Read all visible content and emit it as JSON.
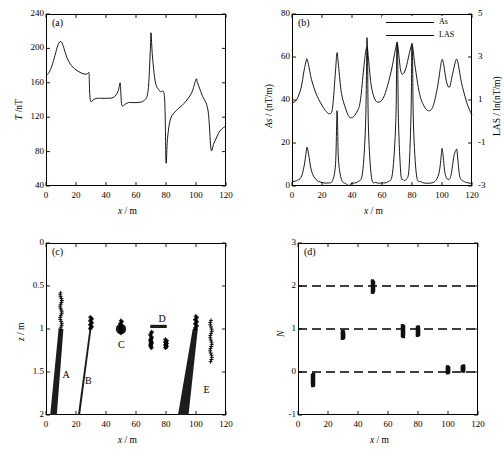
{
  "figure": {
    "panels": [
      "(a)",
      "(b)",
      "(c)",
      "(d)"
    ]
  },
  "axis": {
    "x_label": "x / m",
    "x_ticks": [
      "0",
      "20",
      "40",
      "60",
      "80",
      "100",
      "120"
    ],
    "x_values": [
      0,
      20,
      40,
      60,
      80,
      100,
      120
    ]
  },
  "chart_data": [
    {
      "id": "panel-a",
      "type": "line",
      "tag": "(a)",
      "title": "",
      "xlabel": "x / m",
      "ylabel": "T / nT",
      "xlim": [
        0,
        120
      ],
      "ylim": [
        40,
        240
      ],
      "xticks": [
        0,
        20,
        40,
        60,
        80,
        100,
        120
      ],
      "yticks": [
        40,
        80,
        120,
        160,
        200,
        240
      ],
      "grid": false,
      "legend": "none",
      "series": [
        {
          "name": "T",
          "x": [
            0,
            2,
            4,
            6,
            8,
            10,
            12,
            14,
            17,
            20,
            24,
            27,
            28.6,
            28.8,
            29.2,
            30,
            32,
            35,
            40,
            45,
            48,
            49.4,
            49.8,
            50.3,
            51,
            52,
            55,
            60,
            65,
            68,
            69.6,
            70,
            71,
            73,
            76,
            79,
            80,
            81,
            83,
            87,
            92,
            97,
            100,
            101,
            104,
            108,
            110,
            112,
            116,
            120
          ],
          "y": [
            168,
            172,
            180,
            192,
            204,
            208,
            200,
            189,
            180,
            175,
            171,
            170,
            172,
            166,
            146,
            138,
            141,
            142,
            142,
            143,
            150,
            160,
            152,
            136,
            133,
            134,
            137,
            137,
            139,
            150,
            200,
            218,
            190,
            160,
            150,
            143,
            68,
            95,
            118,
            128,
            136,
            148,
            164,
            160,
            146,
            128,
            83,
            90,
            104,
            110
          ]
        }
      ]
    },
    {
      "id": "panel-b",
      "type": "line",
      "tag": "(b)",
      "title": "",
      "xlabel": "x / m",
      "ylabel": "As / (nT/m)",
      "y2label": "LAS / ln(nT/m)",
      "xlim": [
        0,
        120
      ],
      "ylim": [
        0,
        80
      ],
      "y2lim": [
        -3,
        5
      ],
      "xticks": [
        0,
        20,
        40,
        60,
        80,
        100,
        120
      ],
      "yticks": [
        0,
        20,
        40,
        60,
        80
      ],
      "y2ticks": [
        -3,
        -1,
        1,
        3,
        5
      ],
      "grid": false,
      "legend": [
        "As",
        "LAS"
      ],
      "legend_position": "top-right",
      "series": [
        {
          "name": "As",
          "axis": "left",
          "x": [
            0,
            3,
            6,
            8,
            9.5,
            10,
            11,
            13,
            16,
            20,
            24,
            27,
            29,
            29.8,
            30,
            30.4,
            31,
            33,
            36,
            37.4,
            37.8,
            38.2,
            40,
            44,
            47,
            49,
            49.8,
            50,
            50.4,
            51,
            53,
            56,
            60,
            64,
            67,
            69.2,
            69.8,
            70,
            70.4,
            71,
            72.5,
            74,
            76,
            78,
            79.4,
            79.8,
            80,
            80.4,
            81,
            83,
            86,
            90,
            95,
            98,
            99.6,
            100,
            100.6,
            102,
            104,
            106,
            108,
            109.6,
            110,
            110.6,
            112,
            115,
            118,
            120
          ],
          "y": [
            2,
            2.5,
            4,
            9,
            16,
            18,
            15,
            7,
            3,
            1.6,
            1.4,
            2.5,
            10,
            30,
            35,
            29,
            12,
            3,
            1,
            0.4,
            0.1,
            0.4,
            1.2,
            2,
            6,
            28,
            60,
            69,
            58,
            26,
            4,
            1.6,
            1.4,
            2,
            6,
            30,
            62,
            72,
            63,
            30,
            6,
            3,
            3,
            8,
            35,
            62,
            66,
            58,
            28,
            5,
            2,
            1.3,
            2,
            6,
            15,
            17.5,
            15,
            6,
            3,
            5,
            14,
            17,
            16.5,
            12,
            4,
            2,
            1.4,
            1.2
          ]
        },
        {
          "name": "LAS",
          "axis": "right",
          "x": [
            0,
            3,
            6,
            8,
            9.5,
            10,
            11,
            13,
            16,
            20,
            23,
            25,
            27,
            29,
            30,
            31,
            33,
            36,
            38,
            40,
            42,
            44,
            45,
            46,
            47,
            48,
            49,
            49.6,
            50,
            50.5,
            51,
            53,
            56,
            60,
            63,
            66,
            68,
            69.4,
            70,
            70.6,
            71.5,
            72.5,
            74,
            76,
            78,
            79.4,
            80,
            80.6,
            82,
            85,
            88,
            91,
            94,
            97,
            99,
            100,
            101,
            103,
            105,
            107,
            109,
            110,
            111,
            113,
            116,
            118,
            120
          ],
          "y": [
            0.87,
            1.0,
            1.55,
            2.35,
            2.85,
            2.9,
            2.65,
            1.95,
            1.3,
            0.75,
            0.45,
            0.37,
            0.62,
            2.35,
            3.2,
            2.6,
            1.3,
            0.55,
            0.22,
            0.18,
            0.3,
            0.55,
            0.75,
            1.2,
            1.9,
            2.6,
            3.2,
            3.42,
            3.45,
            3.32,
            2.9,
            1.6,
            0.95,
            1.0,
            1.5,
            2.3,
            3.0,
            3.5,
            3.62,
            3.5,
            2.9,
            2.35,
            2.2,
            2.5,
            3.1,
            3.5,
            3.58,
            3.42,
            2.6,
            1.3,
            0.72,
            0.5,
            0.7,
            1.6,
            2.55,
            2.88,
            2.7,
            1.85,
            1.6,
            2.2,
            2.8,
            2.88,
            2.6,
            1.8,
            1.0,
            0.6,
            0.3
          ]
        }
      ]
    },
    {
      "id": "panel-c",
      "type": "scatter",
      "tag": "(c)",
      "title": "",
      "xlabel": "x / m",
      "ylabel": "z / m",
      "xlim": [
        0,
        120
      ],
      "ylim": [
        2,
        0
      ],
      "y_inverted": true,
      "xticks": [
        0,
        20,
        40,
        60,
        80,
        100,
        120
      ],
      "yticks": [
        0,
        0.5,
        1,
        1.5,
        2
      ],
      "grid": false,
      "legend": "none",
      "bodies": [
        {
          "label": "A",
          "shape": "dipping-wedge",
          "x_top": 10,
          "z_top": 1.0,
          "x_bot": 5,
          "z_bot": 2.0,
          "label_x": 13,
          "label_z": 1.55
        },
        {
          "label": "B",
          "shape": "thin-dike",
          "x_top": 30,
          "z_top": 0.95,
          "x_bot": 22,
          "z_bot": 2.0,
          "label_x": 28,
          "label_z": 1.62
        },
        {
          "label": "C",
          "shape": "sphere",
          "x": 50,
          "z": 1.0,
          "label_x": 50,
          "label_z": 1.2
        },
        {
          "label": "D",
          "shape": "horizontal-plate",
          "x": 75,
          "z": 0.97,
          "label_x": 77,
          "label_z": 0.9
        },
        {
          "label": "E",
          "shape": "wide-dipping-slab",
          "x_top": 100,
          "z_top": 1.0,
          "x_bot": 89,
          "z_bot": 2.0,
          "label_x": 107,
          "label_z": 1.72
        }
      ],
      "solution_clusters": [
        {
          "x": 10,
          "z_range": [
            0.58,
            1.0
          ],
          "marker": "plus"
        },
        {
          "x": 30,
          "z_range": [
            0.86,
            1.0
          ],
          "marker": "plus"
        },
        {
          "x": 50,
          "z_range": [
            0.9,
            1.05
          ],
          "marker": "plus"
        },
        {
          "x": 70,
          "z_range": [
            1.03,
            1.22
          ],
          "marker": "plus"
        },
        {
          "x": 80,
          "z_range": [
            1.12,
            1.22
          ],
          "marker": "plus"
        },
        {
          "x": 100,
          "z_range": [
            0.85,
            1.0
          ],
          "marker": "plus"
        },
        {
          "x": 110,
          "z_range": [
            0.9,
            1.38
          ],
          "marker": "plus"
        }
      ]
    },
    {
      "id": "panel-d",
      "type": "scatter",
      "tag": "(d)",
      "title": "",
      "xlabel": "x / m",
      "ylabel": "N",
      "xlim": [
        0,
        120
      ],
      "ylim": [
        -1,
        3
      ],
      "xticks": [
        0,
        20,
        40,
        60,
        80,
        100,
        120
      ],
      "yticks": [
        -1,
        0,
        1,
        2,
        3
      ],
      "grid": false,
      "reference_lines": [
        0,
        1,
        2
      ],
      "reference_line_style": "dashed",
      "legend": "none",
      "clusters": [
        {
          "x": 10,
          "n_center": -0.2,
          "n_range": [
            -0.32,
            -0.05
          ]
        },
        {
          "x": 30,
          "n_center": 0.85,
          "n_range": [
            0.78,
            0.95
          ]
        },
        {
          "x": 50,
          "n_center": 1.98,
          "n_range": [
            1.85,
            2.12
          ]
        },
        {
          "x": 70,
          "n_center": 1.0,
          "n_range": [
            0.82,
            1.08
          ]
        },
        {
          "x": 80,
          "n_center": 0.95,
          "n_range": [
            0.85,
            1.05
          ]
        },
        {
          "x": 100,
          "n_center": 0.05,
          "n_range": [
            -0.02,
            0.12
          ]
        },
        {
          "x": 110,
          "n_center": 0.08,
          "n_range": [
            0.02,
            0.14
          ]
        }
      ]
    }
  ]
}
